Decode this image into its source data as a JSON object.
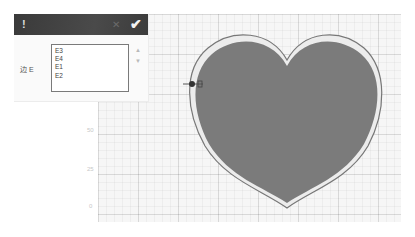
{
  "panel": {
    "header": {
      "warning_icon": "!",
      "close_icon": "✕",
      "confirm_icon": "✔",
      "bg_color": "#3f3f3f"
    },
    "field_label": "边 E",
    "list": {
      "items": [
        "E3",
        "E4",
        "E1",
        "E2"
      ]
    },
    "scroll_up_icon": "▲",
    "scroll_down_icon": "▼"
  },
  "canvas": {
    "axis_labels": [
      "50",
      "25",
      "0"
    ],
    "shape": {
      "type": "heart",
      "fill_color": "#7b7b7b",
      "edge_color": "#f2f2f2",
      "outline_color": "#6a6a6a"
    }
  }
}
